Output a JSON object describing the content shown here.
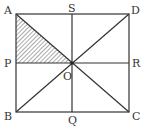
{
  "diagram": {
    "type": "geometry-square",
    "points": {
      "A": {
        "label": "A",
        "x": 16,
        "y": 14
      },
      "S": {
        "label": "S",
        "x": 72,
        "y": 14
      },
      "D": {
        "label": "D",
        "x": 129,
        "y": 14
      },
      "P": {
        "label": "P",
        "x": 16,
        "y": 63
      },
      "O": {
        "label": "O",
        "x": 72,
        "y": 63
      },
      "R": {
        "label": "R",
        "x": 129,
        "y": 63
      },
      "B": {
        "label": "B",
        "x": 16,
        "y": 112
      },
      "Q": {
        "label": "Q",
        "x": 72,
        "y": 112
      },
      "C": {
        "label": "C",
        "x": 129,
        "y": 112
      }
    },
    "segments": [
      "AD",
      "DC",
      "CB",
      "BA",
      "AC",
      "BD",
      "SQ",
      "PR"
    ],
    "shaded_region": [
      "A",
      "P",
      "O"
    ],
    "colors": {
      "line": "#333333",
      "hatch": "#555555"
    }
  }
}
